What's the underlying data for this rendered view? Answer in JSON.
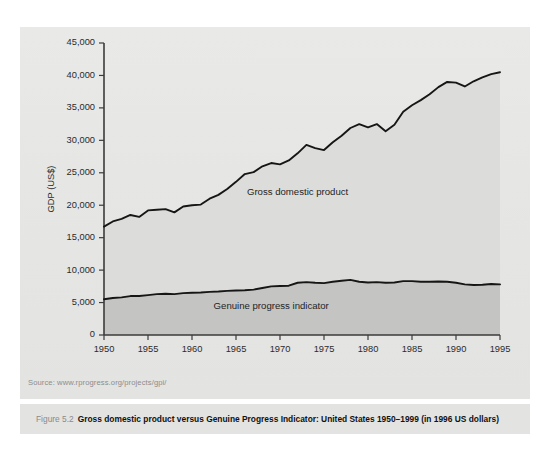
{
  "figure": {
    "number_label": "Figure 5.2",
    "caption": "Gross domestic product versus Genuine Progress Indicator: United States 1950–1999 (in 1996 US dollars)",
    "source": "Source: www.rprogress.org/projects/gpi/"
  },
  "chart_data": {
    "type": "line",
    "title": "",
    "xlabel": "",
    "ylabel": "GDP (US$)",
    "xlim": [
      1950,
      1995
    ],
    "ylim": [
      0,
      45000
    ],
    "grid": false,
    "legend_position": "inline-annotation",
    "xticks": [
      "1950",
      "1955",
      "1960",
      "1965",
      "1970",
      "1975",
      "1980",
      "1985",
      "1990",
      "1995"
    ],
    "xtick_values": [
      1950,
      1955,
      1960,
      1965,
      1970,
      1975,
      1980,
      1985,
      1990,
      1995
    ],
    "yticks": [
      "0",
      "5,000",
      "10,000",
      "15,000",
      "20,000",
      "25,000",
      "30,000",
      "35,000",
      "40,000",
      "45,000"
    ],
    "ytick_values": [
      0,
      5000,
      10000,
      15000,
      20000,
      25000,
      30000,
      35000,
      40000,
      45000
    ],
    "x": [
      1950,
      1951,
      1952,
      1953,
      1954,
      1955,
      1956,
      1957,
      1958,
      1959,
      1960,
      1961,
      1962,
      1963,
      1964,
      1965,
      1966,
      1967,
      1968,
      1969,
      1970,
      1971,
      1972,
      1973,
      1974,
      1975,
      1976,
      1977,
      1978,
      1979,
      1980,
      1981,
      1982,
      1983,
      1984,
      1985,
      1986,
      1987,
      1988,
      1989,
      1990,
      1991,
      1992,
      1993,
      1994,
      1995
    ],
    "series": [
      {
        "name": "Gross domestic product",
        "label": "Gross domestic product",
        "color": "#161616",
        "values": [
          16700,
          17500,
          17900,
          18500,
          18200,
          19200,
          19300,
          19400,
          18900,
          19800,
          20000,
          20100,
          21000,
          21600,
          22500,
          23600,
          24800,
          25100,
          26000,
          26500,
          26300,
          26900,
          28000,
          29300,
          28800,
          28500,
          29700,
          30700,
          31900,
          32500,
          32000,
          32500,
          31400,
          32400,
          34400,
          35400,
          36200,
          37100,
          38200,
          39000,
          38900,
          38300,
          39100,
          39700,
          40200,
          40500
        ]
      },
      {
        "name": "Genuine progress indicator",
        "label": "Genuine progress indicator",
        "color": "#161616",
        "values": [
          5500,
          5700,
          5800,
          6000,
          6000,
          6150,
          6300,
          6350,
          6300,
          6450,
          6500,
          6550,
          6650,
          6700,
          6800,
          6850,
          6900,
          7000,
          7250,
          7500,
          7550,
          7600,
          8050,
          8150,
          8050,
          8000,
          8200,
          8350,
          8500,
          8200,
          8100,
          8150,
          8050,
          8100,
          8300,
          8300,
          8200,
          8200,
          8250,
          8200,
          8050,
          7800,
          7700,
          7750,
          7850,
          7800
        ]
      }
    ],
    "annotations": [
      {
        "text": "Gross domestic product",
        "x": 1972,
        "y": 21500
      },
      {
        "text": "Genuine progress indicator",
        "x": 1969,
        "y": 4000
      }
    ]
  }
}
